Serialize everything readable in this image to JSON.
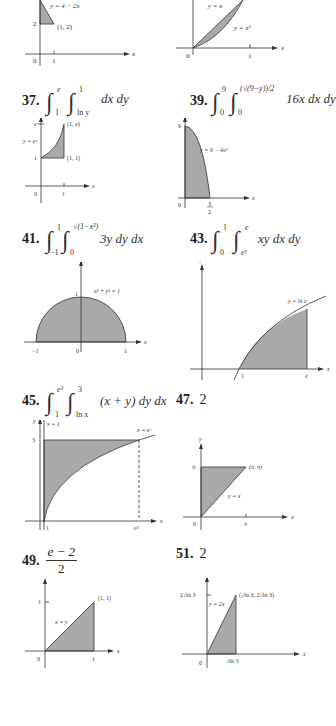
{
  "page": {
    "type": "textbook-answer-key",
    "colors": {
      "fill": "#a9a9a9",
      "axis": "#333333",
      "text": "#222222"
    }
  },
  "problems": [
    {
      "id": "35-partial",
      "number": "",
      "graph": {
        "labels": [
          "y = 4 − 2x",
          "(1, 2)",
          "2",
          "0",
          "1",
          "x"
        ]
      }
    },
    {
      "id": "36-partial",
      "number": "",
      "graph": {
        "labels": [
          "y = x",
          "y = x²",
          "0",
          "1",
          "x"
        ]
      }
    },
    {
      "id": "37",
      "number": "37.",
      "integral": {
        "outer_lower": "1",
        "outer_upper": "e",
        "inner_lower": "ln y",
        "inner_upper": "1",
        "integrand": "dx dy"
      },
      "graph": {
        "labels": [
          "y",
          "e",
          "(1, e)",
          "y = eˣ",
          "1",
          "(1, 1)",
          "0",
          "1",
          "x"
        ]
      }
    },
    {
      "id": "39",
      "number": "39.",
      "integral": {
        "outer_lower": "0",
        "outer_upper": "9",
        "inner_lower": "0",
        "inner_upper": "(√(9−y))/2",
        "integrand": "16x dx dy"
      },
      "graph": {
        "labels": [
          "y",
          "9",
          "y = 9 − 4x²",
          "0",
          "3",
          "2",
          "x"
        ]
      }
    },
    {
      "id": "41",
      "number": "41.",
      "integral": {
        "outer_lower": "−1",
        "outer_upper": "1",
        "inner_lower": "0",
        "inner_upper": "√(1−x²)",
        "integrand": "3y dy dx"
      },
      "graph": {
        "labels": [
          "y",
          "1",
          "x² + y² = 1",
          "−1",
          "0",
          "1",
          "x"
        ]
      }
    },
    {
      "id": "43",
      "number": "43.",
      "integral": {
        "outer_lower": "0",
        "outer_upper": "1",
        "inner_lower": "eʸ",
        "inner_upper": "e",
        "integrand": "xy dx dy"
      },
      "graph": {
        "labels": [
          "y",
          "y = ln x",
          "1",
          "e",
          "x"
        ]
      }
    },
    {
      "id": "45",
      "number": "45.",
      "integral": {
        "outer_lower": "1",
        "outer_upper": "e³",
        "inner_lower": "ln x",
        "inner_upper": "3",
        "integrand": "(x + y) dy dx"
      },
      "graph": {
        "labels": [
          "y",
          "x = 1",
          "x = eʸ",
          "3",
          "1",
          "e³",
          "x"
        ]
      }
    },
    {
      "id": "47",
      "number": "47.",
      "answer": "2",
      "graph": {
        "labels": [
          "y",
          "π",
          "(π, π)",
          "y = x",
          "0",
          "π",
          "x"
        ]
      }
    },
    {
      "id": "49",
      "number": "49.",
      "answer_fraction": {
        "numerator": "e − 2",
        "denominator": "2"
      },
      "graph": {
        "labels": [
          "y",
          "1",
          "(1, 1)",
          "x = y",
          "0",
          "1",
          "x"
        ]
      }
    },
    {
      "id": "51",
      "number": "51.",
      "answer": "2",
      "graph": {
        "labels": [
          "y",
          "2√ln 3",
          "(√ln 3, 2√ln 3)",
          "y = 2x",
          "0",
          "√ln 3",
          "x"
        ]
      }
    }
  ]
}
